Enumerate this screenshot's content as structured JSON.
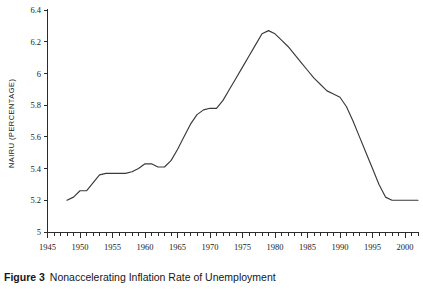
{
  "caption": {
    "label": "Figure 3",
    "title": "Nonaccelerating Inflation Rate of Unemployment"
  },
  "chart_data": {
    "type": "line",
    "title": "",
    "xlabel": "",
    "ylabel": "NAIRU (PERCENTAGE)",
    "xlim": [
      1945,
      2002
    ],
    "ylim": [
      5.0,
      6.4
    ],
    "grid": false,
    "legend": false,
    "y_ticks": [
      5,
      5.2,
      5.4,
      5.6,
      5.8,
      6,
      6.2,
      6.4
    ],
    "y_tick_labels": [
      "5",
      "5.2",
      "5.4",
      "5.6",
      "5.8",
      "6",
      "6.2",
      "6.4"
    ],
    "x_ticks": [
      1945,
      1950,
      1955,
      1960,
      1965,
      1970,
      1975,
      1980,
      1985,
      1990,
      1995,
      2000
    ],
    "x_tick_labels": [
      "1945",
      "1950",
      "1955",
      "1960",
      "1965",
      "1970",
      "1975",
      "1980",
      "1985",
      "1990",
      "1995",
      "2000"
    ],
    "x_minor_tick_step": 1,
    "series": [
      {
        "name": "NAIRU",
        "color": "#3a3a3a",
        "x": [
          1948,
          1949,
          1950,
          1951,
          1952,
          1953,
          1954,
          1955,
          1956,
          1957,
          1958,
          1959,
          1960,
          1961,
          1962,
          1963,
          1964,
          1965,
          1966,
          1967,
          1968,
          1969,
          1970,
          1971,
          1972,
          1973,
          1974,
          1975,
          1976,
          1977,
          1978,
          1979,
          1980,
          1981,
          1982,
          1983,
          1984,
          1985,
          1986,
          1987,
          1988,
          1989,
          1990,
          1991,
          1992,
          1993,
          1994,
          1995,
          1996,
          1997,
          1998,
          1999,
          2000,
          2001,
          2002
        ],
        "values": [
          5.2,
          5.22,
          5.26,
          5.26,
          5.31,
          5.36,
          5.37,
          5.37,
          5.37,
          5.37,
          5.38,
          5.4,
          5.43,
          5.43,
          5.41,
          5.41,
          5.45,
          5.52,
          5.6,
          5.68,
          5.74,
          5.77,
          5.78,
          5.78,
          5.83,
          5.9,
          5.97,
          6.04,
          6.11,
          6.18,
          6.25,
          6.27,
          6.25,
          6.21,
          6.17,
          6.12,
          6.07,
          6.02,
          5.97,
          5.93,
          5.89,
          5.87,
          5.85,
          5.79,
          5.7,
          5.6,
          5.5,
          5.4,
          5.3,
          5.22,
          5.2,
          5.2,
          5.2,
          5.2,
          5.2
        ]
      }
    ]
  }
}
